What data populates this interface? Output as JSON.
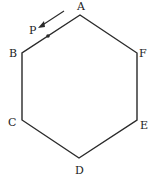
{
  "diagram": {
    "type": "regular hexagon",
    "vertices": [
      {
        "label": "A",
        "x": 80,
        "y": 15,
        "lx": 80,
        "ly": 10
      },
      {
        "label": "F",
        "x": 137,
        "y": 53,
        "lx": 144,
        "ly": 56
      },
      {
        "label": "E",
        "x": 137,
        "y": 120,
        "lx": 144,
        "ly": 126
      },
      {
        "label": "D",
        "x": 79,
        "y": 158,
        "lx": 79,
        "ly": 174
      },
      {
        "label": "C",
        "x": 22,
        "y": 120,
        "lx": 13,
        "ly": 126
      },
      {
        "label": "B",
        "x": 22,
        "y": 53,
        "lx": 14,
        "ly": 56
      }
    ],
    "point": {
      "label": "P",
      "x": 48,
      "y": 36,
      "lx": 33,
      "ly": 33,
      "on_edge": "AB"
    },
    "arrow": {
      "from": [
        64,
        11
      ],
      "to": [
        39,
        27
      ],
      "direction": "toward B along AB"
    },
    "stroke_color": "#2a2a2a"
  }
}
